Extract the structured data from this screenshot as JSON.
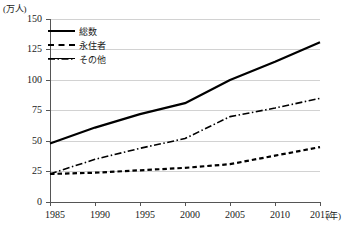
{
  "chart_data": {
    "type": "line",
    "title": "",
    "subtitle": "",
    "xlabel": "(年)",
    "ylabel": "(万人)",
    "x": [
      1985,
      1990,
      1995,
      2000,
      2005,
      2010,
      2015
    ],
    "xtick_labels": [
      "1985",
      "1990",
      "1995",
      "2000",
      "2005",
      "2010",
      "2015"
    ],
    "ytick_labels": [
      "0",
      "25",
      "50",
      "75",
      "100",
      "125",
      "150"
    ],
    "yticks": [
      0,
      25,
      50,
      75,
      100,
      125,
      150
    ],
    "xlim": [
      1985,
      2015
    ],
    "ylim": [
      0,
      150
    ],
    "grid": "horizontal",
    "legend_position": "top-left",
    "series": [
      {
        "name": "総数",
        "style": "solid",
        "color": "#000000",
        "values": [
          48,
          61,
          72,
          81,
          100,
          115,
          131
        ]
      },
      {
        "name": "永住者",
        "style": "dashed",
        "color": "#000000",
        "values": [
          23,
          24,
          26,
          28,
          31,
          38,
          45
        ]
      },
      {
        "name": "その他",
        "style": "dashdot",
        "color": "#000000",
        "values": [
          23,
          35,
          44,
          52,
          70,
          77,
          85
        ]
      }
    ]
  },
  "axis": {
    "y_unit_label": "(万人)",
    "x_unit_label": "(年)",
    "y_labels": [
      "150",
      "125",
      "100",
      "75",
      "50",
      "25",
      "0"
    ],
    "x_labels": [
      "1985",
      "1990",
      "1995",
      "2000",
      "2005",
      "2010",
      "2015"
    ]
  },
  "legend": {
    "items": [
      {
        "label": "総数",
        "style": "solid"
      },
      {
        "label": "永住者",
        "style": "dashed"
      },
      {
        "label": "その他",
        "style": "dashdot"
      }
    ]
  },
  "colors": {
    "line": "#000000",
    "grid": "#d2d2d2",
    "axis": "#555555",
    "text": "#1a1a1a",
    "background": "#ffffff"
  }
}
